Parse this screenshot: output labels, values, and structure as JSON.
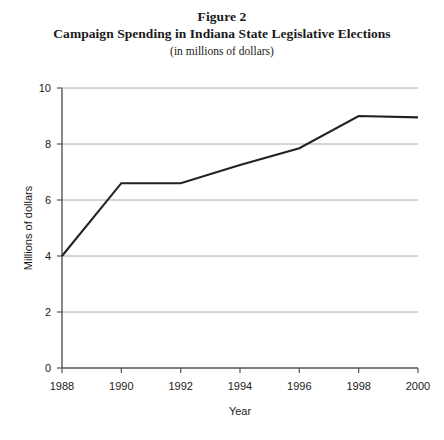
{
  "figure": {
    "label": "Figure 2",
    "title": "Campaign Spending in Indiana State Legislative Elections",
    "subtitle": "(in millions of dollars)"
  },
  "chart_data": {
    "type": "line",
    "title": "Campaign Spending in Indiana State Legislative Elections",
    "subtitle": "(in millions of dollars)",
    "xlabel": "Year",
    "ylabel": "Millions of dollars",
    "x": [
      1988,
      1990,
      1992,
      1994,
      1996,
      1998,
      2000
    ],
    "values": [
      4.0,
      6.6,
      6.6,
      7.25,
      7.85,
      9.0,
      8.95
    ],
    "series": [
      {
        "name": "Campaign spending",
        "values": [
          4.0,
          6.6,
          6.6,
          7.25,
          7.85,
          9.0,
          8.95
        ]
      }
    ],
    "xlim": [
      1988,
      2000
    ],
    "ylim": [
      0,
      10
    ],
    "xticks": [
      1988,
      1990,
      1992,
      1994,
      1996,
      1998,
      2000
    ],
    "xtick_labels": [
      "1988",
      "1990",
      "1992",
      "1994",
      "1996",
      "1998",
      "2000"
    ],
    "yticks": [
      0,
      2,
      4,
      6,
      8,
      10
    ],
    "ytick_labels": [
      "0",
      "2",
      "4",
      "6",
      "8",
      "10"
    ],
    "grid": "horizontal",
    "legend": "none",
    "line_color": "#222222",
    "grid_color": "#aaaaaa",
    "axis_color": "#555555",
    "background": "#ffffff"
  }
}
